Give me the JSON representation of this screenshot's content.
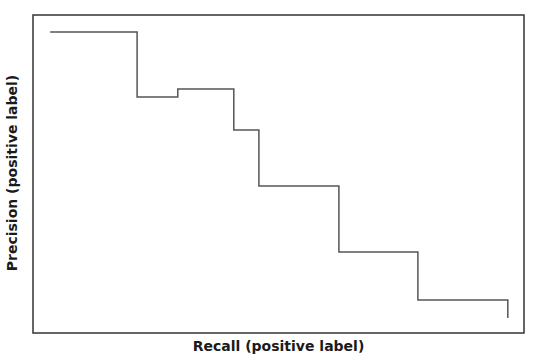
{
  "chart_data": {
    "type": "line",
    "step": true,
    "title": "",
    "xlabel": "Recall (positive label)",
    "ylabel": "Precision (positive label)",
    "xlim": [
      0,
      1
    ],
    "ylim": [
      0,
      1
    ],
    "grid": false,
    "legend": null,
    "tick_labels_shown": false,
    "series": [
      {
        "name": "precision-recall",
        "color": "#555555",
        "points": [
          [
            0.035,
            0.947
          ],
          [
            0.212,
            0.947
          ],
          [
            0.212,
            0.742
          ],
          [
            0.295,
            0.742
          ],
          [
            0.295,
            0.767
          ],
          [
            0.409,
            0.767
          ],
          [
            0.409,
            0.638
          ],
          [
            0.46,
            0.638
          ],
          [
            0.46,
            0.462
          ],
          [
            0.623,
            0.462
          ],
          [
            0.623,
            0.255
          ],
          [
            0.784,
            0.255
          ],
          [
            0.784,
            0.104
          ],
          [
            0.967,
            0.104
          ],
          [
            0.967,
            0.047
          ]
        ]
      }
    ]
  },
  "plot": {
    "box": {
      "x": 33,
      "y": 15,
      "w": 491,
      "h": 318
    },
    "frame_color": "#333333",
    "line_color": "#555555"
  }
}
